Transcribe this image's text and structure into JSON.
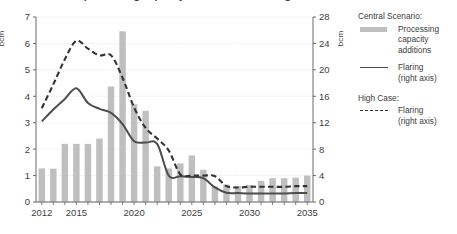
{
  "chart_data": {
    "type": "bar",
    "title": "Gas processing capacity additions and flaring",
    "xlabel": "",
    "ylabel": "bcm",
    "y2label": "bcm",
    "ylim": [
      0,
      7
    ],
    "y2lim": [
      0,
      28
    ],
    "ytick_labels": [
      "0",
      "1",
      "2",
      "3",
      "4",
      "5",
      "6",
      "7"
    ],
    "y2tick_labels": [
      "0",
      "4",
      "8",
      "12",
      "16",
      "20",
      "24",
      "28"
    ],
    "xtick_labels": [
      "2012",
      "2015",
      "2020",
      "2025",
      "2030",
      "2035"
    ],
    "x": [
      2012,
      2013,
      2014,
      2015,
      2016,
      2017,
      2018,
      2019,
      2020,
      2021,
      2022,
      2023,
      2024,
      2025,
      2026,
      2027,
      2028,
      2029,
      2030,
      2031,
      2032,
      2033,
      2034,
      2035
    ],
    "grid": "horizontal",
    "legend_position": "right",
    "series": [
      {
        "name": "Processing capacity additions",
        "group": "Central Scenario:",
        "type": "bar",
        "axis": "left",
        "color": "#bfbfbf",
        "values": [
          1.27,
          1.26,
          2.2,
          2.2,
          2.2,
          2.4,
          4.37,
          6.46,
          3.7,
          3.45,
          1.35,
          1.27,
          1.46,
          1.76,
          1.22,
          0.59,
          0.66,
          0.6,
          0.64,
          0.8,
          0.9,
          0.9,
          0.92,
          1.0
        ]
      },
      {
        "name": "Flaring (right axis)",
        "group": "Central Scenario:",
        "type": "line",
        "style": "solid",
        "axis": "right",
        "color": "#4d4d4d",
        "values": [
          12.2,
          14.0,
          15.6,
          17.2,
          15.0,
          14.1,
          13.5,
          11.8,
          9.2,
          9.0,
          8.8,
          4.0,
          3.9,
          3.8,
          3.6,
          2.2,
          1.4,
          1.35,
          1.3,
          1.3,
          1.3,
          1.3,
          1.35,
          1.35
        ]
      },
      {
        "name": "Flaring (right axis)",
        "group": "High Case:",
        "type": "line",
        "style": "dashed",
        "axis": "right",
        "color": "#333333",
        "values": [
          14.2,
          17.8,
          21.6,
          24.4,
          23.2,
          22.2,
          22.2,
          18.8,
          14.3,
          11.2,
          9.6,
          7.8,
          4.2,
          4.0,
          4.0,
          3.9,
          2.4,
          2.2,
          2.3,
          2.3,
          2.3,
          2.3,
          2.4,
          2.4
        ]
      }
    ]
  },
  "axes": {
    "left_unit": "bcm",
    "right_unit": "bcm"
  },
  "legend": {
    "groups": [
      {
        "title": "Central Scenario:",
        "entries": [
          {
            "swatch": "bar-swatch",
            "line1": "Processing",
            "line2": "capacity",
            "line3": "additions"
          },
          {
            "swatch": "solid-line-swatch",
            "line1": "Flaring",
            "line2": "(right axis)",
            "line3": ""
          }
        ]
      },
      {
        "title": "High Case:",
        "entries": [
          {
            "swatch": "dashed-line-swatch",
            "line1": "Flaring",
            "line2": "(right axis)",
            "line3": ""
          }
        ]
      }
    ]
  }
}
